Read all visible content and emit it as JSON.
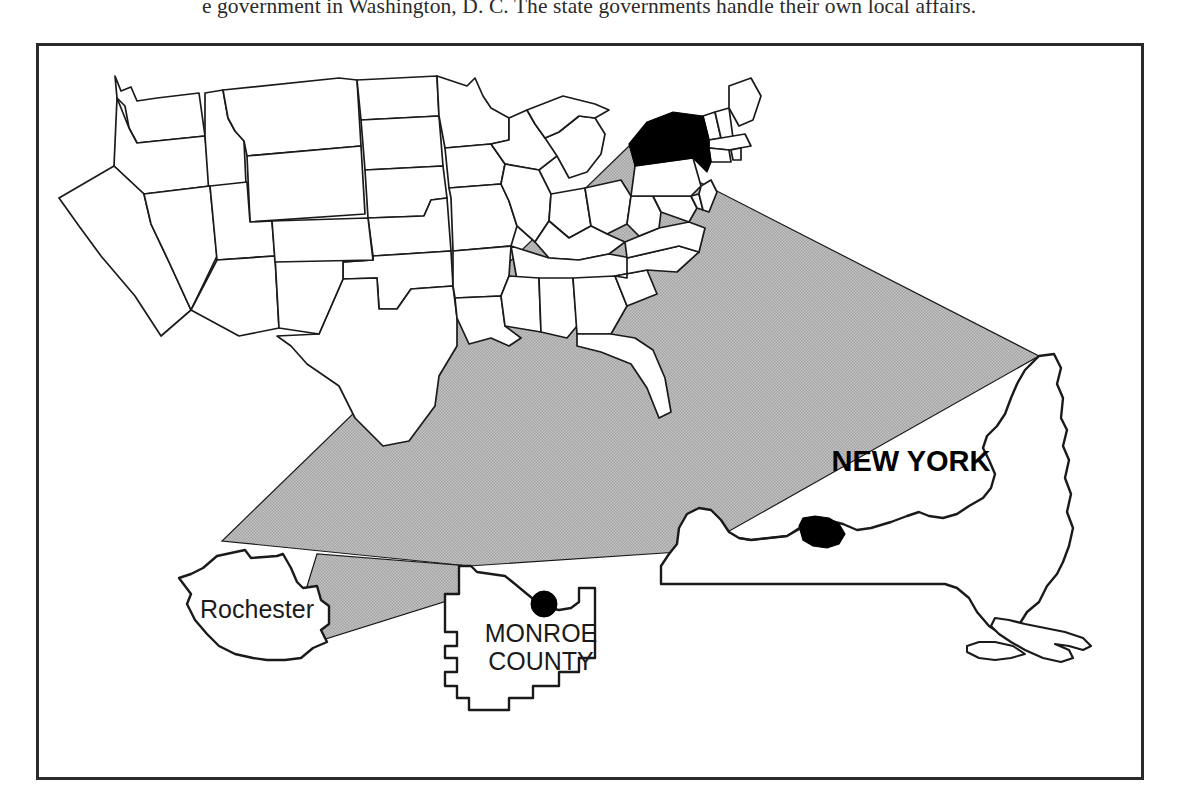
{
  "page": {
    "body_text_line": "e government in Washington, D. C. The state governments handle their own local affairs."
  },
  "figure": {
    "name": "locator-map-new-york-monroe-county-rochester",
    "frame_border_color": "#2a2a2a",
    "background_color": "#ffffff",
    "highlight_fill": "#000000",
    "cone_fill": "#b3b3b3",
    "outline_color": "#1a1a1a",
    "labels": {
      "state": "NEW YORK",
      "county_line1": "MONROE",
      "county_line2": "COUNTY",
      "city": "Rochester"
    },
    "levels": [
      {
        "id": "usa",
        "name": "United States",
        "note": "48 contiguous states outline, New York filled black"
      },
      {
        "id": "new-york",
        "name": "NEW YORK",
        "note": "enlarged state outline, Monroe County filled black"
      },
      {
        "id": "monroe-county",
        "name": "MONROE COUNTY",
        "note": "enlarged county outline, Rochester shown as black dot"
      },
      {
        "id": "rochester",
        "name": "Rochester",
        "note": "enlarged city outline"
      }
    ]
  }
}
